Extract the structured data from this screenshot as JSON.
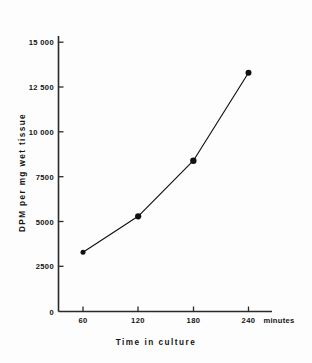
{
  "chart_data": {
    "type": "line",
    "title": "",
    "subtitle": "",
    "xlabel": "Time in culture",
    "ylabel": "DPM per mg wet tissue",
    "x_unit": "minutes",
    "x": [
      60,
      120,
      180,
      240
    ],
    "values": [
      3300,
      5300,
      8400,
      13300
    ],
    "series": [
      {
        "name": "DPM per mg wet tissue",
        "values": [
          3300,
          5300,
          8400,
          13300
        ],
        "marker": "filled-circle",
        "color": "#111111"
      }
    ],
    "xlim": [
      0,
      270
    ],
    "ylim": [
      0,
      16000
    ],
    "x_ticks": [
      60,
      120,
      180,
      240
    ],
    "x_tick_labels": [
      "60",
      "120",
      "180",
      "240"
    ],
    "y_ticks": [
      0,
      2500,
      5000,
      7500,
      10000,
      12500,
      15000
    ],
    "y_tick_labels": [
      "0",
      "2500",
      "5000",
      "7500",
      "10 000",
      "12 500",
      "15 000"
    ],
    "grid": false,
    "legend": null,
    "legend_position": "none",
    "annotations": []
  },
  "axes": {
    "y_ticks": [
      {
        "label": "15 000",
        "value": 15000
      },
      {
        "label": "12 500",
        "value": 12500
      },
      {
        "label": "10 000",
        "value": 10000
      },
      {
        "label": "7500",
        "value": 7500
      },
      {
        "label": "5000",
        "value": 5000
      },
      {
        "label": "2500",
        "value": 2500
      },
      {
        "label": "0",
        "value": 0
      }
    ],
    "x_ticks": [
      {
        "label": "60",
        "value": 60
      },
      {
        "label": "120",
        "value": 120
      },
      {
        "label": "180",
        "value": 180
      },
      {
        "label": "240",
        "value": 240
      }
    ],
    "x_unit_label": "minutes",
    "x_title": "Time in culture",
    "y_title": "DPM per mg wet tissue"
  },
  "style": {
    "line_color": "#111111",
    "marker_color": "#111111",
    "axis_color": "#2a2a2a",
    "background": "#fdfdfd"
  }
}
